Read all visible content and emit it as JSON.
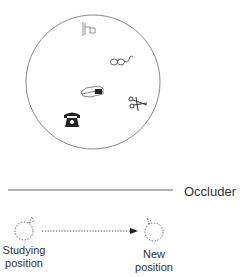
{
  "diagram": {
    "array": {
      "shape": "circle",
      "center": [
        93,
        82
      ],
      "radius": 67,
      "objects": [
        {
          "name": "flag",
          "icon": "flag-icon",
          "x": 88,
          "y": 28
        },
        {
          "name": "glasses",
          "icon": "glasses-icon",
          "x": 121,
          "y": 61
        },
        {
          "name": "stapler",
          "icon": "stapler-icon",
          "x": 91,
          "y": 92
        },
        {
          "name": "scissors",
          "icon": "scissors-icon",
          "x": 138,
          "y": 104
        },
        {
          "name": "telephone",
          "icon": "telephone-icon",
          "x": 71,
          "y": 120
        }
      ]
    },
    "occluder": {
      "label": "Occluder",
      "line": {
        "x1": 8,
        "x2": 173,
        "y": 190
      }
    },
    "viewer_positions": {
      "studying": {
        "label_line1": "Studying",
        "label_line2": "position",
        "x": 24,
        "y": 231
      },
      "new": {
        "label_line1": "New",
        "label_line2": "position",
        "x": 154,
        "y": 231
      }
    },
    "movement_arrow": {
      "style": "dotted",
      "from": [
        42,
        231
      ],
      "to": [
        138,
        231
      ]
    },
    "colors": {
      "stroke": "#888888",
      "text": "#333333",
      "icon": "#222222"
    }
  }
}
